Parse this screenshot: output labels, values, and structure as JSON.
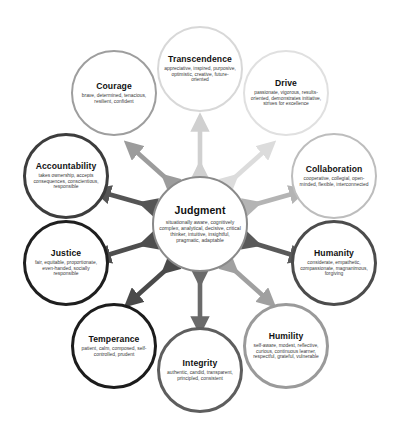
{
  "center": {
    "name": "Judgment",
    "descriptors": "situationally aware, cognitively complex, analytical, decisive, critical thinker, intuitive, insightful, pragmatic, adaptable",
    "ring_color": "#8a8a8a"
  },
  "nodes": [
    {
      "name": "Transcendence",
      "descriptors": "appreciative, inspired, purposive, optimistic, creative, future-oriented",
      "ring_color": "#d8d8d8",
      "position": "top"
    },
    {
      "name": "Drive",
      "descriptors": "passionate, vigorous, results-oriented, demonstrates initiative, strives for excellence",
      "ring_color": "#e0e0e0",
      "position": "top-right"
    },
    {
      "name": "Collaboration",
      "descriptors": "cooperative, collegial, open-minded, flexible, interconnected",
      "ring_color": "#bdbdbd",
      "position": "right-upper"
    },
    {
      "name": "Humanity",
      "descriptors": "considerate, empathetic, compassionate, magnanimous, forgiving",
      "ring_color": "#4c4c4c",
      "position": "right-lower"
    },
    {
      "name": "Humility",
      "descriptors": "self-aware, modest, reflective, curious, continuous learner, respectful, grateful, vulnerable",
      "ring_color": "#9a9a9a",
      "position": "bottom-right"
    },
    {
      "name": "Integrity",
      "descriptors": "authentic, candid, transparent, principled, consistent",
      "ring_color": "#5e5e5e",
      "position": "bottom"
    },
    {
      "name": "Temperance",
      "descriptors": "patient, calm, composed, self-controlled, prudent",
      "ring_color": "#1c1c1c",
      "position": "bottom-left"
    },
    {
      "name": "Justice",
      "descriptors": "fair, equitable, proportionate, even-handed, socially responsible",
      "ring_color": "#1f1f1f",
      "position": "left-lower"
    },
    {
      "name": "Accountability",
      "descriptors": "takes ownership, accepts consequences, conscientious, responsible",
      "ring_color": "#3d3d3d",
      "position": "left-upper"
    },
    {
      "name": "Courage",
      "descriptors": "brave, determined, tenacious, resilient, confident",
      "ring_color": "#9e9e9e",
      "position": "top-left"
    }
  ],
  "connectors": {
    "style": "double-headed-arrow",
    "count": 10,
    "colors": [
      "#d0d0d0",
      "#dcdcdc",
      "#b4b4b4",
      "#5a5a5a",
      "#a0a0a0",
      "#6a6a6a",
      "#4a4a4a",
      "#4e4e4e",
      "#555555",
      "#9c9c9c"
    ]
  },
  "background_color": "#ffffff"
}
